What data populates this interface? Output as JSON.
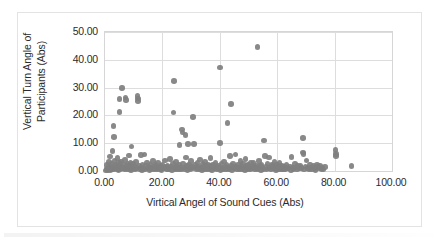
{
  "figure": {
    "background_color": "#ffffff",
    "frame_color": "#e3e3e3",
    "plot_border_color": "#d6d6d6",
    "gridline_color": "#dddddd",
    "marker_color": "#7f7f7f"
  },
  "chart_data": {
    "type": "scatter",
    "title": "",
    "xlabel": "Virtical Angel of Sound Cues (Abs)",
    "ylabel": "Vertical Turn Angle of Participants (Abs)",
    "xlim": [
      0,
      100
    ],
    "ylim": [
      0,
      50
    ],
    "xticks": [
      0,
      20,
      40,
      60,
      80,
      100
    ],
    "yticks": [
      0,
      10,
      20,
      30,
      40,
      50
    ],
    "xticklabels": [
      "0.00",
      "20.00",
      "40.00",
      "60.00",
      "80.00",
      "100.00"
    ],
    "yticklabels": [
      "0.00",
      "10.00",
      "20.00",
      "30.00",
      "40.00",
      "50.00"
    ],
    "grid": true,
    "grid_axis": "both",
    "legend": false,
    "legend_position": "none",
    "marker_color": "#7f7f7f",
    "marker_size": 5.6,
    "series": [
      {
        "name": "Participants",
        "points": [
          [
            0.4,
            0.2
          ],
          [
            0.6,
            0.9
          ],
          [
            0.8,
            2.1
          ],
          [
            1.0,
            0.3
          ],
          [
            1.2,
            1.4
          ],
          [
            1.4,
            3.2
          ],
          [
            1.5,
            0.6
          ],
          [
            1.7,
            5.2
          ],
          [
            1.9,
            0.4
          ],
          [
            2.1,
            1.1
          ],
          [
            2.2,
            2.6
          ],
          [
            2.4,
            0.8
          ],
          [
            2.6,
            7.3
          ],
          [
            2.7,
            1.6
          ],
          [
            2.9,
            0.5
          ],
          [
            3.0,
            16.1
          ],
          [
            3.1,
            12.3
          ],
          [
            3.3,
            3.7
          ],
          [
            3.5,
            0.9
          ],
          [
            3.7,
            2.2
          ],
          [
            3.9,
            1.3
          ],
          [
            4.1,
            0.6
          ],
          [
            4.3,
            4.6
          ],
          [
            4.5,
            1.8
          ],
          [
            4.7,
            0.4
          ],
          [
            4.9,
            2.9
          ],
          [
            5.0,
            25.8
          ],
          [
            5.1,
            21.2
          ],
          [
            5.2,
            1.2
          ],
          [
            5.4,
            0.7
          ],
          [
            5.6,
            3.4
          ],
          [
            5.8,
            1.5
          ],
          [
            6.0,
            29.8
          ],
          [
            6.2,
            0.9
          ],
          [
            6.4,
            2.3
          ],
          [
            6.6,
            1.1
          ],
          [
            6.8,
            0.5
          ],
          [
            7.0,
            3.9
          ],
          [
            7.2,
            26.4
          ],
          [
            7.3,
            25.6
          ],
          [
            7.5,
            1.7
          ],
          [
            7.7,
            0.8
          ],
          [
            7.9,
            2.5
          ],
          [
            8.1,
            1.2
          ],
          [
            8.3,
            5.6
          ],
          [
            8.5,
            0.6
          ],
          [
            8.7,
            1.9
          ],
          [
            8.9,
            3.1
          ],
          [
            9.1,
            0.4
          ],
          [
            9.3,
            8.8
          ],
          [
            9.5,
            1.4
          ],
          [
            9.7,
            2.7
          ],
          [
            9.9,
            0.9
          ],
          [
            10.2,
            1.6
          ],
          [
            10.5,
            0.5
          ],
          [
            10.8,
            3.3
          ],
          [
            11.0,
            1.1
          ],
          [
            11.3,
            27.0
          ],
          [
            11.5,
            26.1
          ],
          [
            11.6,
            25.1
          ],
          [
            11.8,
            2.0
          ],
          [
            12.0,
            0.7
          ],
          [
            12.3,
            1.3
          ],
          [
            12.6,
            5.7
          ],
          [
            12.9,
            0.4
          ],
          [
            13.1,
            2.4
          ],
          [
            13.4,
            1.0
          ],
          [
            13.7,
            6.0
          ],
          [
            14.0,
            0.6
          ],
          [
            14.3,
            1.8
          ],
          [
            14.6,
            3.0
          ],
          [
            14.9,
            0.9
          ],
          [
            15.2,
            1.5
          ],
          [
            15.5,
            0.3
          ],
          [
            15.8,
            2.2
          ],
          [
            16.1,
            1.2
          ],
          [
            16.4,
            0.7
          ],
          [
            16.7,
            3.6
          ],
          [
            17.0,
            1.4
          ],
          [
            17.3,
            0.5
          ],
          [
            17.6,
            2.1
          ],
          [
            17.9,
            1.0
          ],
          [
            18.2,
            0.8
          ],
          [
            18.5,
            2.8
          ],
          [
            18.8,
            1.3
          ],
          [
            19.1,
            0.6
          ],
          [
            19.4,
            1.7
          ],
          [
            19.7,
            0.4
          ],
          [
            20.0,
            2.3
          ],
          [
            20.3,
            1.1
          ],
          [
            20.6,
            0.9
          ],
          [
            20.9,
            3.8
          ],
          [
            21.2,
            1.5
          ],
          [
            21.5,
            0.5
          ],
          [
            21.8,
            2.0
          ],
          [
            22.1,
            1.2
          ],
          [
            22.4,
            0.7
          ],
          [
            22.7,
            4.4
          ],
          [
            23.0,
            1.6
          ],
          [
            23.3,
            0.4
          ],
          [
            23.6,
            2.5
          ],
          [
            23.9,
            21.0
          ],
          [
            24.0,
            32.3
          ],
          [
            24.2,
            1.0
          ],
          [
            24.5,
            0.8
          ],
          [
            24.8,
            3.2
          ],
          [
            25.1,
            1.4
          ],
          [
            25.4,
            0.6
          ],
          [
            25.7,
            2.2
          ],
          [
            26.0,
            9.4
          ],
          [
            26.2,
            1.1
          ],
          [
            26.5,
            0.5
          ],
          [
            26.8,
            15.0
          ],
          [
            27.0,
            13.8
          ],
          [
            27.2,
            2.7
          ],
          [
            27.5,
            1.3
          ],
          [
            27.8,
            0.7
          ],
          [
            28.0,
            13.0
          ],
          [
            28.2,
            4.9
          ],
          [
            28.5,
            1.8
          ],
          [
            28.8,
            0.4
          ],
          [
            29.0,
            9.8
          ],
          [
            29.2,
            2.4
          ],
          [
            29.5,
            1.0
          ],
          [
            29.8,
            0.6
          ],
          [
            30.0,
            3.5
          ],
          [
            30.3,
            1.5
          ],
          [
            30.6,
            19.4
          ],
          [
            30.8,
            0.9
          ],
          [
            31.0,
            9.7
          ],
          [
            31.3,
            2.1
          ],
          [
            31.6,
            1.2
          ],
          [
            31.9,
            0.5
          ],
          [
            32.2,
            2.9
          ],
          [
            32.5,
            1.6
          ],
          [
            32.8,
            0.8
          ],
          [
            33.1,
            4.1
          ],
          [
            33.4,
            1.1
          ],
          [
            33.7,
            0.4
          ],
          [
            34.0,
            2.6
          ],
          [
            34.3,
            1.4
          ],
          [
            34.6,
            0.7
          ],
          [
            34.9,
            3.3
          ],
          [
            35.2,
            1.9
          ],
          [
            35.5,
            0.5
          ],
          [
            35.8,
            2.2
          ],
          [
            36.1,
            1.0
          ],
          [
            36.4,
            0.6
          ],
          [
            36.7,
            4.7
          ],
          [
            37.0,
            1.7
          ],
          [
            37.3,
            0.3
          ],
          [
            37.6,
            2.4
          ],
          [
            37.9,
            1.3
          ],
          [
            38.2,
            0.9
          ],
          [
            38.5,
            3.0
          ],
          [
            38.8,
            1.5
          ],
          [
            39.1,
            0.6
          ],
          [
            39.4,
            2.0
          ],
          [
            39.7,
            1.1
          ],
          [
            40.0,
            37.3
          ],
          [
            40.1,
            10.1
          ],
          [
            40.3,
            0.4
          ],
          [
            40.6,
            2.7
          ],
          [
            40.9,
            1.2
          ],
          [
            41.2,
            0.8
          ],
          [
            41.5,
            3.4
          ],
          [
            41.8,
            1.6
          ],
          [
            42.1,
            0.5
          ],
          [
            42.4,
            2.3
          ],
          [
            42.7,
            17.3
          ],
          [
            43.0,
            1.0
          ],
          [
            43.3,
            0.7
          ],
          [
            43.6,
            5.3
          ],
          [
            43.9,
            1.8
          ],
          [
            44.0,
            24.2
          ],
          [
            44.2,
            0.4
          ],
          [
            44.5,
            2.5
          ],
          [
            44.8,
            1.3
          ],
          [
            45.1,
            0.9
          ],
          [
            45.4,
            5.9
          ],
          [
            45.7,
            1.5
          ],
          [
            46.0,
            0.6
          ],
          [
            46.3,
            2.1
          ],
          [
            46.6,
            1.1
          ],
          [
            46.9,
            0.5
          ],
          [
            47.2,
            3.7
          ],
          [
            47.5,
            1.7
          ],
          [
            47.8,
            0.8
          ],
          [
            48.1,
            2.6
          ],
          [
            48.4,
            1.2
          ],
          [
            48.7,
            0.4
          ],
          [
            49.0,
            4.3
          ],
          [
            49.3,
            1.9
          ],
          [
            49.6,
            0.7
          ],
          [
            49.9,
            2.2
          ],
          [
            50.2,
            1.0
          ],
          [
            50.5,
            0.6
          ],
          [
            50.8,
            3.1
          ],
          [
            51.1,
            1.4
          ],
          [
            51.4,
            0.9
          ],
          [
            51.7,
            2.8
          ],
          [
            52.0,
            1.6
          ],
          [
            52.3,
            0.5
          ],
          [
            52.6,
            2.0
          ],
          [
            52.9,
            1.1
          ],
          [
            53.2,
            44.5
          ],
          [
            53.4,
            0.7
          ],
          [
            53.7,
            3.5
          ],
          [
            54.0,
            1.8
          ],
          [
            54.3,
            0.4
          ],
          [
            54.6,
            2.4
          ],
          [
            54.9,
            1.2
          ],
          [
            55.2,
            0.8
          ],
          [
            55.5,
            10.9
          ],
          [
            55.7,
            5.4
          ],
          [
            56.0,
            1.5
          ],
          [
            56.3,
            0.6
          ],
          [
            56.6,
            2.7
          ],
          [
            56.9,
            1.0
          ],
          [
            57.2,
            4.8
          ],
          [
            57.5,
            1.3
          ],
          [
            57.8,
            0.5
          ],
          [
            58.1,
            2.1
          ],
          [
            58.4,
            1.7
          ],
          [
            58.7,
            0.9
          ],
          [
            59.0,
            3.2
          ],
          [
            59.3,
            1.1
          ],
          [
            59.6,
            0.4
          ],
          [
            59.9,
            2.3
          ],
          [
            60.2,
            1.4
          ],
          [
            60.5,
            0.7
          ],
          [
            60.8,
            2.9
          ],
          [
            61.1,
            1.2
          ],
          [
            61.4,
            0.6
          ],
          [
            61.7,
            1.9
          ],
          [
            62.0,
            0.8
          ],
          [
            62.4,
            1.5
          ],
          [
            62.8,
            0.5
          ],
          [
            63.2,
            2.2
          ],
          [
            63.6,
            1.0
          ],
          [
            64.0,
            0.9
          ],
          [
            64.4,
            1.6
          ],
          [
            64.8,
            0.4
          ],
          [
            65.0,
            5.1
          ],
          [
            65.3,
            1.2
          ],
          [
            65.7,
            0.7
          ],
          [
            66.1,
            2.5
          ],
          [
            66.5,
            1.3
          ],
          [
            66.9,
            0.6
          ],
          [
            67.3,
            1.8
          ],
          [
            67.7,
            0.9
          ],
          [
            68.1,
            2.0
          ],
          [
            68.5,
            1.1
          ],
          [
            68.9,
            6.6
          ],
          [
            69.0,
            11.8
          ],
          [
            69.2,
            6.2
          ],
          [
            69.4,
            0.5
          ],
          [
            69.8,
            1.6
          ],
          [
            70.2,
            3.8
          ],
          [
            70.6,
            1.0
          ],
          [
            71.0,
            0.8
          ],
          [
            71.4,
            2.4
          ],
          [
            71.8,
            1.3
          ],
          [
            72.2,
            0.6
          ],
          [
            72.6,
            1.9
          ],
          [
            73.0,
            1.1
          ],
          [
            73.4,
            0.4
          ],
          [
            73.8,
            2.1
          ],
          [
            74.2,
            1.5
          ],
          [
            74.6,
            0.9
          ],
          [
            75.0,
            1.7
          ],
          [
            75.4,
            0.7
          ],
          [
            75.8,
            1.2
          ],
          [
            76.2,
            0.5
          ],
          [
            76.6,
            1.4
          ],
          [
            80.3,
            7.6
          ],
          [
            80.4,
            6.1
          ],
          [
            80.5,
            5.4
          ],
          [
            85.9,
            1.8
          ]
        ]
      }
    ]
  }
}
